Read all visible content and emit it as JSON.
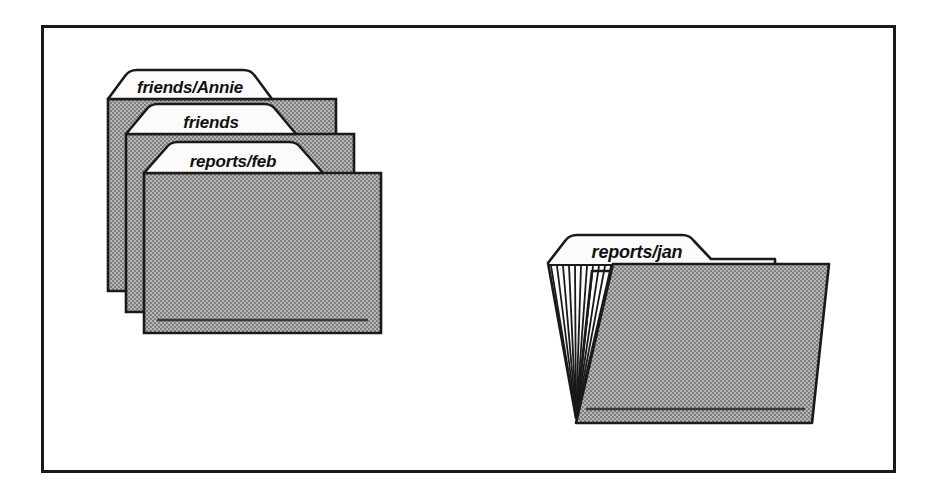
{
  "figure": {
    "border": {
      "name": "outer-frame",
      "color": "#1a1a1a",
      "x": 41,
      "y": 25,
      "width": 854,
      "height": 447,
      "stroke_width": 3
    },
    "colors": {
      "background": "#ffffff",
      "folder_body_fill": "#9d9d9d",
      "folder_tab_fill": "#fbfbfb",
      "outline": "#1a1a1a",
      "accent_line": "#3a3a3a"
    }
  },
  "stack": {
    "name": "folder-stack-left",
    "count": 3,
    "folders": [
      {
        "label": "friends/Annie",
        "position": "back",
        "z": 1,
        "label_font_size": 17
      },
      {
        "label": "friends",
        "position": "middle",
        "z": 2,
        "label_font_size": 17
      },
      {
        "label": "reports/feb",
        "position": "front",
        "z": 3,
        "label_font_size": 17
      }
    ]
  },
  "open_folder": {
    "name": "open-folder-right",
    "label": "reports/jan",
    "label_font_size": 18,
    "gusset_pleats": 11,
    "has_front_panel": true,
    "has_bottom_rule": true
  }
}
